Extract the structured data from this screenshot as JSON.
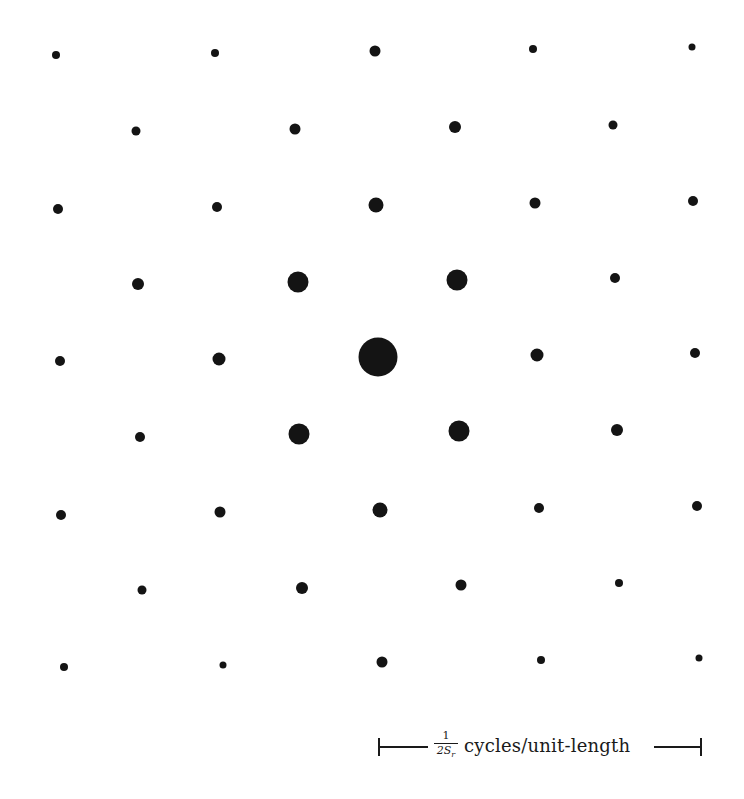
{
  "figure": {
    "dot_color": "#141414",
    "background": "#ffffff"
  },
  "dots": [
    {
      "x": 56,
      "y": 55,
      "d": 8
    },
    {
      "x": 215,
      "y": 53,
      "d": 8
    },
    {
      "x": 375,
      "y": 51,
      "d": 11
    },
    {
      "x": 533,
      "y": 49,
      "d": 8
    },
    {
      "x": 692,
      "y": 47,
      "d": 7
    },
    {
      "x": 136,
      "y": 131,
      "d": 9
    },
    {
      "x": 295,
      "y": 129,
      "d": 11
    },
    {
      "x": 455,
      "y": 127,
      "d": 12
    },
    {
      "x": 613,
      "y": 125,
      "d": 9
    },
    {
      "x": 58,
      "y": 209,
      "d": 10
    },
    {
      "x": 217,
      "y": 207,
      "d": 10
    },
    {
      "x": 376,
      "y": 205,
      "d": 15
    },
    {
      "x": 535,
      "y": 203,
      "d": 11
    },
    {
      "x": 693,
      "y": 201,
      "d": 10
    },
    {
      "x": 138,
      "y": 284,
      "d": 12
    },
    {
      "x": 298,
      "y": 282,
      "d": 21
    },
    {
      "x": 457,
      "y": 280,
      "d": 21
    },
    {
      "x": 615,
      "y": 278,
      "d": 10
    },
    {
      "x": 60,
      "y": 361,
      "d": 10
    },
    {
      "x": 219,
      "y": 359,
      "d": 13
    },
    {
      "x": 378,
      "y": 357,
      "d": 39
    },
    {
      "x": 537,
      "y": 355,
      "d": 13
    },
    {
      "x": 695,
      "y": 353,
      "d": 10
    },
    {
      "x": 140,
      "y": 437,
      "d": 10
    },
    {
      "x": 299,
      "y": 434,
      "d": 21
    },
    {
      "x": 459,
      "y": 431,
      "d": 21
    },
    {
      "x": 617,
      "y": 430,
      "d": 12
    },
    {
      "x": 61,
      "y": 515,
      "d": 10
    },
    {
      "x": 220,
      "y": 512,
      "d": 11
    },
    {
      "x": 380,
      "y": 510,
      "d": 15
    },
    {
      "x": 539,
      "y": 508,
      "d": 10
    },
    {
      "x": 697,
      "y": 506,
      "d": 10
    },
    {
      "x": 142,
      "y": 590,
      "d": 9
    },
    {
      "x": 302,
      "y": 588,
      "d": 12
    },
    {
      "x": 461,
      "y": 585,
      "d": 11
    },
    {
      "x": 619,
      "y": 583,
      "d": 8
    },
    {
      "x": 64,
      "y": 667,
      "d": 8
    },
    {
      "x": 223,
      "y": 665,
      "d": 7
    },
    {
      "x": 382,
      "y": 662,
      "d": 11
    },
    {
      "x": 541,
      "y": 660,
      "d": 8
    },
    {
      "x": 699,
      "y": 658,
      "d": 7
    }
  ],
  "scale_bar": {
    "numerator": "1",
    "denominator": "2S",
    "denominator_subscript": "r",
    "label": "cycles/unit-length"
  }
}
